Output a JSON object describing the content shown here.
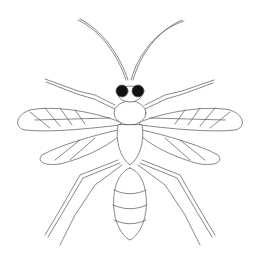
{
  "figure": {
    "subject": "wasp",
    "style": "scientific line drawing, dorsal view",
    "colors": {
      "background": "#ffffff",
      "line": "#555555",
      "eye": "#111111"
    },
    "parts": [
      "antennae",
      "head",
      "compound-eyes",
      "forelegs",
      "thorax",
      "forewings",
      "hindwings",
      "midlegs",
      "hindlegs",
      "abdomen"
    ]
  }
}
